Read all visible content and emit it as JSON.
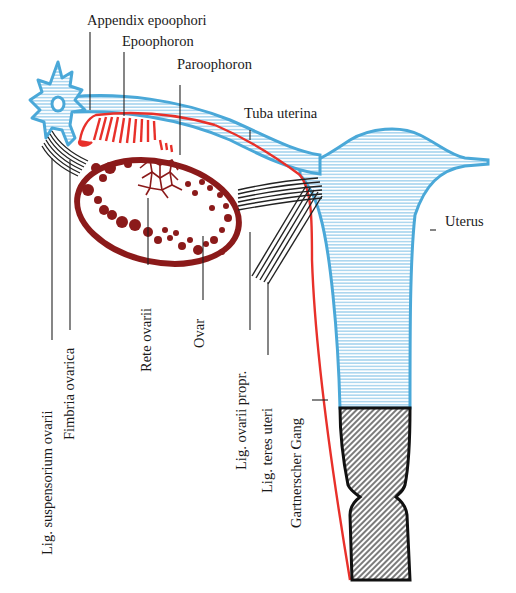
{
  "diagram": {
    "type": "anatomical-illustration",
    "colors": {
      "tube_uterus": "#4aa8d8",
      "epoophoron_duct": "#e8302a",
      "ovary": "#8b1a1a",
      "ligaments": "#222222",
      "cervix_vagina": "#1a1a1a"
    }
  },
  "labels": {
    "appendix_epoophori": "Appendix epoophori",
    "epoophoron": "Epoophoron",
    "paroophoron": "Paroophoron",
    "tuba_uterina": "Tuba uterina",
    "uterus": "Uterus",
    "lig_suspensorium_ovarii": "Lig. suspensorium ovarii",
    "fimbria_ovarica": "Fimbria ovarica",
    "rete_ovarii": "Rete ovarii",
    "ovar": "Ovar",
    "lig_ovarii_propr": "Lig. ovarii propr.",
    "lig_teres_uteri": "Lig. teres uteri",
    "gartnerscher_gang": "Gartnerscher Gang"
  }
}
